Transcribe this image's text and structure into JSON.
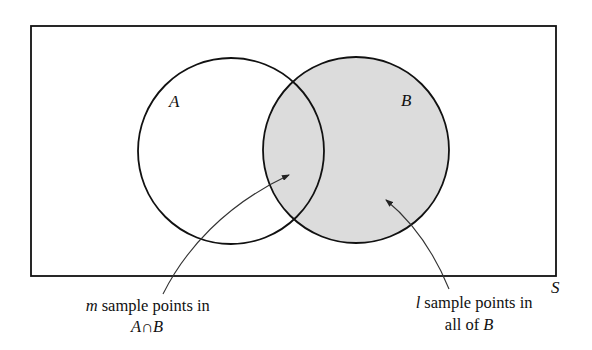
{
  "diagram": {
    "type": "venn",
    "universe": {
      "label": "S"
    },
    "sets": [
      {
        "id": "A",
        "label": "A",
        "shaded": false
      },
      {
        "id": "B",
        "label": "B",
        "shaded": true
      }
    ],
    "shaded_region": "B",
    "annotations": [
      {
        "target": "A∩B",
        "line1_var": "m",
        "line1_text": " sample points in",
        "line2_parts": [
          "A",
          "∩",
          "B"
        ]
      },
      {
        "target": "B",
        "line1_var": "l",
        "line1_text": " sample points in",
        "line2_text": "all of ",
        "line2_var": "B"
      }
    ],
    "colors": {
      "stroke": "#111111",
      "shade_fill": "#dcdcdc",
      "background": "#ffffff"
    }
  }
}
